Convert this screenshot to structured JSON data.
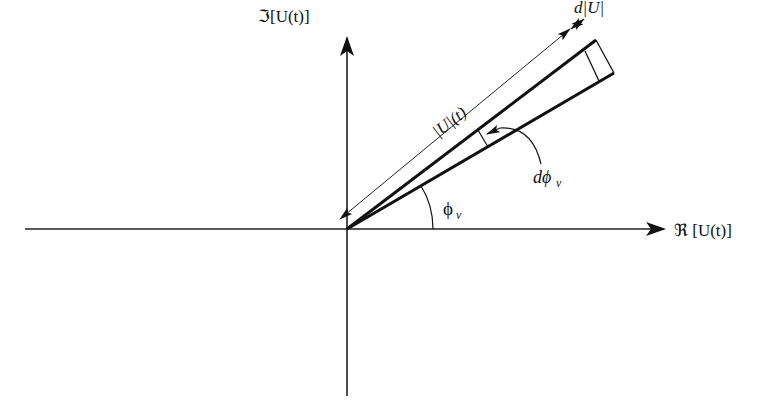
{
  "diagram": {
    "type": "phasor-diagram",
    "colors": {
      "background": "#ffffff",
      "ink": "#111111"
    },
    "axes": {
      "horizontal": {
        "label": "ℜ [U(t)]"
      },
      "vertical": {
        "label": "ℑ[U(t)]"
      }
    },
    "annotations": {
      "magnitude": "|U|(t)",
      "magnitude_increment": "d|U|",
      "phase": "ϕ",
      "phase_subscript": "v",
      "phase_increment_prefix": "dϕ",
      "phase_increment_subscript": "v"
    }
  }
}
